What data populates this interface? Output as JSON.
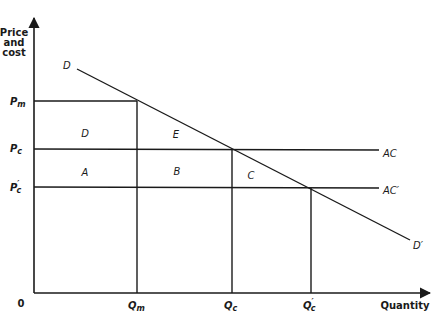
{
  "diagram": {
    "type": "economics-monopoly-vs-competition",
    "y_axis_label_lines": [
      "Price",
      "and",
      "cost"
    ],
    "x_axis_label": "Quantity",
    "origin_label": "0",
    "price_labels": {
      "pm": {
        "main": "P",
        "sub": "m"
      },
      "pc": {
        "main": "P",
        "sub": "c"
      },
      "pc_prime": {
        "main": "P",
        "sub": "c",
        "prime": "′"
      }
    },
    "quantity_labels": {
      "qm": {
        "main": "Q",
        "sub": "m"
      },
      "qc": {
        "main": "Q",
        "sub": "c"
      },
      "qc_prime": {
        "main": "Q",
        "sub": "c",
        "prime": "′"
      }
    },
    "curves": {
      "demand_start": "D",
      "demand_end": "D′",
      "ac": "AC",
      "ac_prime": "AC′"
    },
    "regions": {
      "d": "D",
      "e": "E",
      "a": "A",
      "b": "B",
      "c": "C"
    },
    "colors": {
      "ink": "#1a1a1a",
      "background": "#ffffff"
    }
  }
}
